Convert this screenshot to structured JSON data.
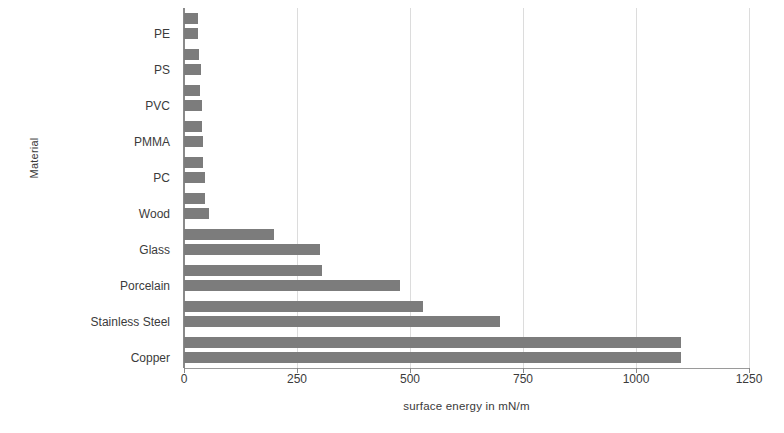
{
  "chart_data": {
    "type": "bar",
    "orientation": "horizontal",
    "title": "",
    "xlabel": "surface energy in mN/m",
    "ylabel": "Material",
    "categories": [
      "PE",
      "PS",
      "PVC",
      "PMMA",
      "PC",
      "Wood",
      "Glass",
      "Porcelain",
      "Stainless Steel",
      "Copper"
    ],
    "values": [
      31,
      38,
      40,
      41,
      46,
      55,
      300,
      477,
      700,
      1100
    ],
    "series": [
      {
        "name": "upper",
        "values": [
          31,
          33,
          36,
          40,
          42,
          46,
          200,
          305,
          528,
          1100
        ]
      },
      {
        "name": "lower",
        "values": [
          31,
          38,
          40,
          41,
          46,
          55,
          300,
          477,
          700,
          1100
        ]
      }
    ],
    "xlim": [
      0,
      1250
    ],
    "xticks": [
      0,
      250,
      500,
      750,
      1000,
      1250
    ],
    "xtick_labels": [
      "0",
      "250",
      "500",
      "750",
      "1000",
      "1250"
    ],
    "grid": true,
    "grid_axis": "x",
    "legend": false,
    "bar_color": "#7c7c7c",
    "grid_color": "#dcdcdc",
    "axis_color": "#8a8a8a",
    "text_color": "#3b3b3b"
  }
}
